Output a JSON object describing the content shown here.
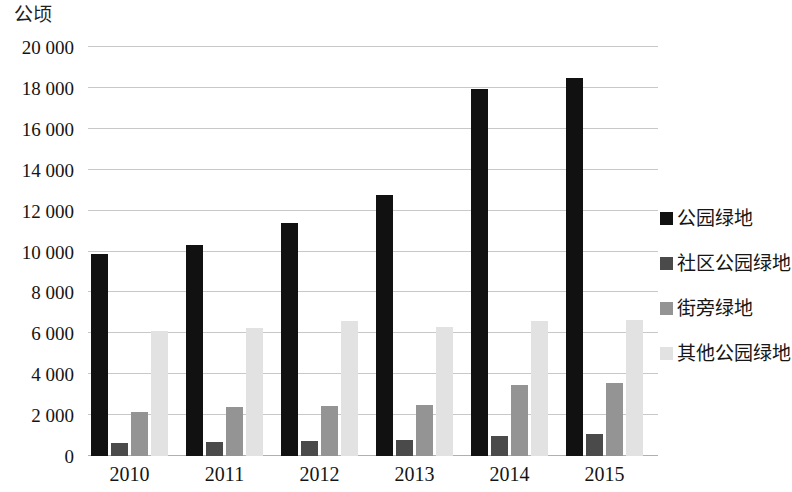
{
  "chart_data": {
    "type": "bar",
    "title": "",
    "subtitle": "",
    "xlabel": "",
    "ylabel": "公顷",
    "unit_caption": "公顷",
    "categories": [
      "2010",
      "2011",
      "2012",
      "2013",
      "2014",
      "2015"
    ],
    "ylim": [
      0,
      20000
    ],
    "ytick_values": [
      0,
      2000,
      4000,
      6000,
      8000,
      10000,
      12000,
      14000,
      16000,
      18000,
      20000
    ],
    "ytick_labels": [
      "0",
      "2 000",
      "4 000",
      "6 000",
      "8 000",
      "10 000",
      "12 000",
      "14 000",
      "16 000",
      "18 000",
      "20 000"
    ],
    "grid": true,
    "legend_position": "right",
    "series": [
      {
        "name": "公园绿地",
        "color": "#111111",
        "values": [
          9900,
          10300,
          11400,
          12750,
          17950,
          18500
        ]
      },
      {
        "name": "社区公园绿地",
        "color": "#4a4a4a",
        "values": [
          620,
          700,
          740,
          760,
          1000,
          1060
        ]
      },
      {
        "name": "街旁绿地",
        "color": "#949494",
        "values": [
          2150,
          2420,
          2470,
          2500,
          3450,
          3560
        ]
      },
      {
        "name": "其他公园绿地",
        "color": "#e2e2e2",
        "values": [
          6100,
          6280,
          6620,
          6320,
          6600,
          6650
        ]
      }
    ]
  }
}
